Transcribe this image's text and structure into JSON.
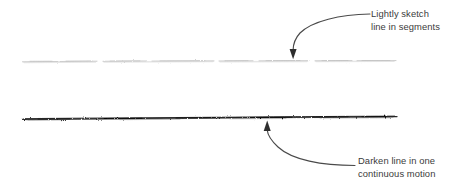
{
  "figure": {
    "type": "instructional-drawing-diagram",
    "background_color": "#ffffff",
    "width": 465,
    "height": 194
  },
  "strokes": {
    "light_line": {
      "name": "lightly-sketched-line",
      "description": "faint horizontal line drawn in short broken segments",
      "color": "#c9c9c9",
      "y": 61,
      "x_start": 22,
      "x_end": 396,
      "style": "segmented"
    },
    "dark_line": {
      "name": "darkened-line",
      "description": "dark horizontal line drawn in one continuous motion",
      "color": "#1d1d1d",
      "y": 118,
      "x_start": 22,
      "x_end": 397,
      "style": "continuous"
    }
  },
  "annotations": {
    "top": {
      "name": "lightly-sketch-annotation",
      "text_line_1": "Lightly sketch",
      "text_line_2": "line in segments",
      "text_color": "#3b3b3b",
      "arrow_color": "#4a4a4a",
      "arrow_target_x": 293,
      "arrow_target_y": 58
    },
    "bottom": {
      "name": "darken-line-annotation",
      "text_line_1": "Darken line in one",
      "text_line_2": "continuous motion",
      "text_color": "#3b3b3b",
      "arrow_color": "#4a4a4a",
      "arrow_target_x": 267,
      "arrow_target_y": 121
    }
  }
}
